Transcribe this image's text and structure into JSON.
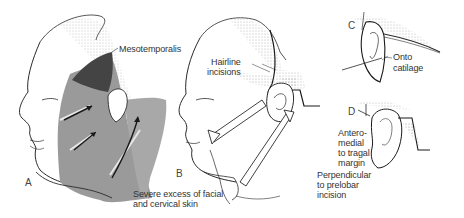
{
  "figure": {
    "panels": [
      {
        "id": "A",
        "letter": "A",
        "labels": [
          "Mesotemporalis"
        ]
      },
      {
        "id": "B",
        "letter": "B",
        "labels": [
          "Hairline incisions",
          "Severe excess of facial and cervical skin"
        ]
      },
      {
        "id": "C",
        "letter": "C",
        "labels": [
          "Onto catilage"
        ]
      },
      {
        "id": "D",
        "letter": "D",
        "labels": [
          "Antero-medial to tragal margin",
          "Perpendicular to prelobar incision"
        ]
      }
    ],
    "labels": {
      "mesotemporalis": "Mesotemporalis",
      "hairline_1": "Hairline",
      "hairline_2": "incisions",
      "severe_1": "Severe excess of facial",
      "severe_2": "and cervical skin",
      "onto_1": "Onto",
      "onto_2": "catilage",
      "antero_1": "Antero-",
      "antero_2": "medial",
      "antero_3": "to tragal",
      "antero_4": "margin",
      "perp_1": "Perpendicular",
      "perp_2": "to prelobar",
      "perp_3": "incision"
    },
    "letters": {
      "a": "A",
      "b": "B",
      "c": "C",
      "d": "D"
    },
    "colors": {
      "line": "#2a2a2a",
      "shade": "#9a9a9a",
      "dark_shade": "#3c3c3c",
      "stipple": "#b5b5b5",
      "text": "#333333"
    }
  }
}
